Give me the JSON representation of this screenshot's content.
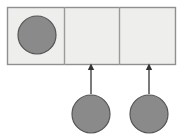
{
  "figure": {
    "kind": "diagram",
    "canvas": {
      "width": 191,
      "height": 139,
      "background": "#ffffff"
    }
  },
  "palette": {
    "circle_fill": "#8a8a8a",
    "circle_stroke": "#555555",
    "cell_fill": "#eeeeec",
    "cell_stroke": "#9a9a9a",
    "container_stroke": "#8f8f8f",
    "arrow_color": "#333333"
  },
  "container": {
    "name": "three-cell-bar",
    "x": 7,
    "y": 7,
    "width": 169,
    "height": 58,
    "cell_count": 3,
    "divider_x": [
      64,
      119
    ]
  },
  "cells": [
    {
      "index": 1,
      "label": "cell-1",
      "x": 7,
      "y": 7,
      "width": 57,
      "height": 58,
      "filled": true,
      "content": "circle"
    },
    {
      "index": 2,
      "label": "cell-2",
      "x": 64,
      "y": 7,
      "width": 55,
      "height": 58,
      "filled": false,
      "content": "empty"
    },
    {
      "index": 3,
      "label": "cell-3",
      "x": 119,
      "y": 7,
      "width": 57,
      "height": 58,
      "filled": false,
      "content": "empty"
    }
  ],
  "circles": [
    {
      "id": "circle-in-cell-1",
      "cx": 37,
      "cy": 35,
      "r": 19,
      "location": "inside-cell-1"
    },
    {
      "id": "circle-below-cell-2",
      "cx": 91,
      "cy": 114,
      "r": 19,
      "location": "below-cell-2"
    },
    {
      "id": "circle-below-cell-3",
      "cx": 149,
      "cy": 114,
      "r": 19,
      "location": "below-cell-3"
    }
  ],
  "arrows": [
    {
      "id": "arrow-to-cell-2",
      "x": 91,
      "tail_y": 94,
      "head_y": 67,
      "direction": "up",
      "from": "circle-below-cell-2",
      "to": "cell-2"
    },
    {
      "id": "arrow-to-cell-3",
      "x": 149,
      "tail_y": 94,
      "head_y": 67,
      "direction": "up",
      "from": "circle-below-cell-3",
      "to": "cell-3"
    }
  ],
  "labels": {
    "caption": "",
    "cell_1_text": "",
    "cell_2_text": "",
    "cell_3_text": ""
  }
}
